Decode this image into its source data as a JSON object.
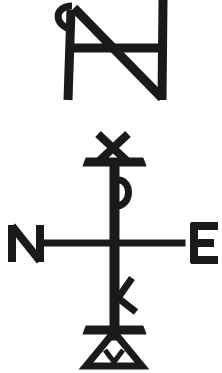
{
  "figure": {
    "background": "#ffffff",
    "ink": "#1a1a1a",
    "top_monogram": {
      "description": "monogram combining N/A/H with small loop"
    },
    "cross_monogram": {
      "description": "staff cross with X top, rho loop, kappa arm, triangle base",
      "left_letter": "N",
      "right_letter": "E"
    }
  }
}
